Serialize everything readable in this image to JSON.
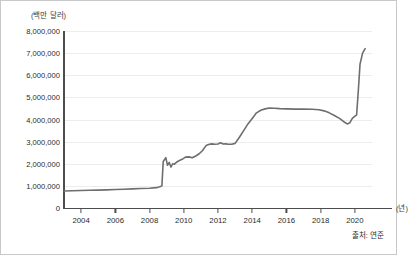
{
  "chart_data": {
    "type": "line",
    "title": "",
    "subtitle": "",
    "xlabel": "(년)",
    "ylabel": "(백만 달러)",
    "y_unit_label": "(백만 달러)",
    "x_unit_label": "(년)",
    "source_note": "출처: 연준",
    "grid": true,
    "legend": "none",
    "xlim": [
      2003.0,
      2021.0
    ],
    "ylim": [
      0,
      8000000
    ],
    "ytick_labels": [
      "8,000,000",
      "7,000,000",
      "6,000,000",
      "5,000,000",
      "4,000,000",
      "3,000,000",
      "2,000,000",
      "1,000,000",
      "0"
    ],
    "ytick_values": [
      8000000,
      7000000,
      6000000,
      5000000,
      4000000,
      3000000,
      2000000,
      1000000,
      0
    ],
    "xtick_labels": [
      "2004",
      "2006",
      "2008",
      "2010",
      "2012",
      "2014",
      "2016",
      "2018",
      "2020"
    ],
    "xtick_values": [
      2004,
      2006,
      2008,
      2010,
      2012,
      2014,
      2016,
      2018,
      2020
    ],
    "series": [
      {
        "name": "연준 총자산",
        "color": "#6e6e6e",
        "x": [
          2003.0,
          2003.5,
          2004.0,
          2004.5,
          2005.0,
          2005.5,
          2006.0,
          2006.5,
          2007.0,
          2007.5,
          2008.0,
          2008.4,
          2008.6,
          2008.72,
          2008.8,
          2008.95,
          2009.05,
          2009.15,
          2009.25,
          2009.35,
          2009.45,
          2009.6,
          2009.75,
          2009.9,
          2010.1,
          2010.3,
          2010.5,
          2010.7,
          2010.9,
          2011.1,
          2011.3,
          2011.5,
          2011.65,
          2011.8,
          2012.0,
          2012.15,
          2012.3,
          2012.45,
          2012.6,
          2012.8,
          2013.0,
          2013.25,
          2013.5,
          2013.75,
          2014.0,
          2014.25,
          2014.5,
          2014.75,
          2015.0,
          2015.3,
          2015.6,
          2016.0,
          2016.5,
          2017.0,
          2017.5,
          2017.9,
          2018.2,
          2018.5,
          2018.8,
          2019.1,
          2019.35,
          2019.55,
          2019.7,
          2019.85,
          2020.0,
          2020.1,
          2020.2,
          2020.3,
          2020.45,
          2020.6
        ],
        "values": [
          770000,
          780000,
          790000,
          800000,
          810000,
          820000,
          835000,
          850000,
          865000,
          880000,
          895000,
          920000,
          960000,
          1000000,
          2100000,
          2280000,
          1930000,
          2060000,
          1850000,
          2000000,
          1980000,
          2080000,
          2150000,
          2200000,
          2300000,
          2310000,
          2270000,
          2350000,
          2450000,
          2600000,
          2820000,
          2880000,
          2900000,
          2880000,
          2890000,
          2950000,
          2890000,
          2900000,
          2880000,
          2880000,
          2920000,
          3200000,
          3500000,
          3800000,
          4050000,
          4300000,
          4420000,
          4480000,
          4520000,
          4510000,
          4490000,
          4480000,
          4470000,
          4470000,
          4460000,
          4440000,
          4390000,
          4300000,
          4180000,
          4050000,
          3900000,
          3800000,
          3850000,
          4050000,
          4150000,
          4200000,
          5300000,
          6500000,
          7000000,
          7200000
        ]
      }
    ],
    "annotations": [],
    "peak_value": 7200000,
    "start_value": 770000
  }
}
